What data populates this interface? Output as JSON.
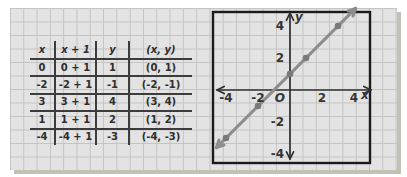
{
  "table": {
    "headers": [
      "x",
      "x + 1",
      "y",
      "(x, y)"
    ],
    "rows": [
      [
        "0",
        "0 + 1",
        "1",
        "(0, 1)"
      ],
      [
        "-2",
        "-2 + 1",
        "-1",
        "(-2, -1)"
      ],
      [
        "3",
        "3 + 1",
        "4",
        "(3, 4)"
      ],
      [
        "1",
        "1 + 1",
        "2",
        "(1, 2)"
      ],
      [
        "-4",
        "-4 + 1",
        "-3",
        "(-4, -3)"
      ]
    ]
  },
  "chart_data": {
    "type": "line",
    "title": "",
    "xlabel": "x",
    "ylabel": "y",
    "origin_label": "O",
    "line_slope": 1,
    "line_intercept": 1,
    "line_x_span": [
      -4.6,
      4.1
    ],
    "points": [
      [
        -4,
        -3
      ],
      [
        -2,
        -1
      ],
      [
        0,
        1
      ],
      [
        1,
        2
      ],
      [
        3,
        4
      ]
    ],
    "x_ticks": [
      -4,
      -2,
      2,
      4
    ],
    "y_ticks": [
      4,
      2,
      -2,
      -4
    ],
    "x_range": [
      -5,
      5
    ],
    "y_range": [
      -5,
      5
    ],
    "grid": "background graph paper",
    "colors": {
      "paper": "#e3e3e3",
      "grid_line": "#c3c3c3",
      "ink": "#2e2e2e",
      "axis": "#303030",
      "box": "#1b1b1b",
      "line": "#8d8d8d",
      "point": "#7a7a7a"
    }
  }
}
